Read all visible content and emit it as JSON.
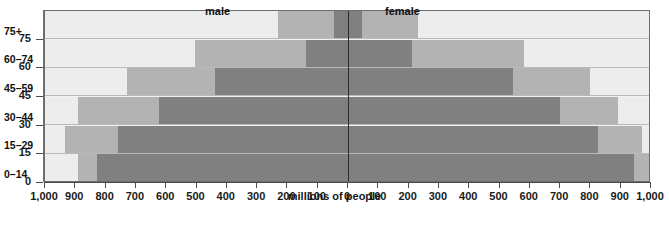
{
  "chart_data": {
    "type": "bar",
    "subtype": "population-pyramid",
    "title": "",
    "xlabel": "millions of people",
    "ylabel": "age",
    "categories": [
      "0–14",
      "15–29",
      "30–44",
      "45–59",
      "60–74",
      "75+"
    ],
    "y_tick_labels": [
      "0",
      "15",
      "30",
      "45",
      "60",
      "75"
    ],
    "x_tick_labels_left": [
      "1,000",
      "900",
      "800",
      "700",
      "600",
      "500",
      "400",
      "300",
      "200",
      "100"
    ],
    "x_tick_labels_right": [
      "0",
      "100",
      "200",
      "300",
      "400",
      "500",
      "600",
      "700",
      "800",
      "900",
      "1,000"
    ],
    "xlim": [
      -1000,
      1000
    ],
    "x_tick_step": 100,
    "grid": false,
    "legend_position": "in-plot-top",
    "series": [
      {
        "name": "male",
        "label": "male",
        "side": "left",
        "values": [
          830,
          760,
          625,
          440,
          305,
          200
        ]
      },
      {
        "name": "female",
        "label": "female",
        "side": "right",
        "values": [
          790,
          725,
          640,
          460,
          330,
          230
        ]
      }
    ],
    "stack_bands": {
      "description": "Each bar is drawn in three shading bands from the axis outward",
      "male": [
        {
          "age": "0–14",
          "dark_to": 830,
          "medium_to": 890,
          "light_to": 1000
        },
        {
          "age": "15–29",
          "dark_to": 760,
          "medium_to": 935,
          "light_to": 1000
        },
        {
          "age": "30–44",
          "dark_to": 625,
          "medium_to": 890,
          "light_to": 1000
        },
        {
          "age": "45–59",
          "dark_to": 440,
          "medium_to": 730,
          "light_to": 1000
        },
        {
          "age": "60–74",
          "dark_to": 140,
          "medium_to": 505,
          "light_to": 1000
        },
        {
          "age": "75+",
          "dark_to": 45,
          "medium_to": 230,
          "light_to": 1000
        }
      ],
      "female": [
        {
          "age": "0–14",
          "dark_to": 945,
          "medium_to": 1000,
          "light_to": 1000
        },
        {
          "age": "15–29",
          "dark_to": 825,
          "medium_to": 970,
          "light_to": 1000
        },
        {
          "age": "30–44",
          "dark_to": 700,
          "medium_to": 890,
          "light_to": 1000
        },
        {
          "age": "45–59",
          "dark_to": 545,
          "medium_to": 800,
          "light_to": 1000
        },
        {
          "age": "60–74",
          "dark_to": 210,
          "medium_to": 580,
          "light_to": 1000
        },
        {
          "age": "75+",
          "dark_to": 45,
          "medium_to": 230,
          "light_to": 1000
        }
      ]
    },
    "colors": {
      "dark": "#808080",
      "medium": "#b3b3b3",
      "light": "#ededed",
      "axis": "#4a4a4a",
      "center_axis": "#2b2b2b",
      "text": "#1a1a1a",
      "background": "#ffffff"
    }
  },
  "axis": {
    "y_title": "age",
    "x_title": "millions of people"
  },
  "labels": {
    "male": "male",
    "female": "female"
  },
  "bands": {
    "b0": "0–14",
    "b1": "15–29",
    "b2": "30–44",
    "b3": "45–59",
    "b4": "60–74",
    "b5": "75+"
  },
  "y_ticks": {
    "t0": "0",
    "t1": "15",
    "t2": "30",
    "t3": "45",
    "t4": "60",
    "t5": "75"
  },
  "x_ticks": {
    "l1000": "1,000",
    "l900": "900",
    "l800": "800",
    "l700": "700",
    "l600": "600",
    "l500": "500",
    "l400": "400",
    "l300": "300",
    "l200": "200",
    "l100": "100",
    "zero": "0",
    "r100": "100",
    "r200": "200",
    "r300": "300",
    "r400": "400",
    "r500": "500",
    "r600": "600",
    "r700": "700",
    "r800": "800",
    "r900": "900",
    "r1000": "1,000"
  },
  "caption": {
    "text": ""
  }
}
